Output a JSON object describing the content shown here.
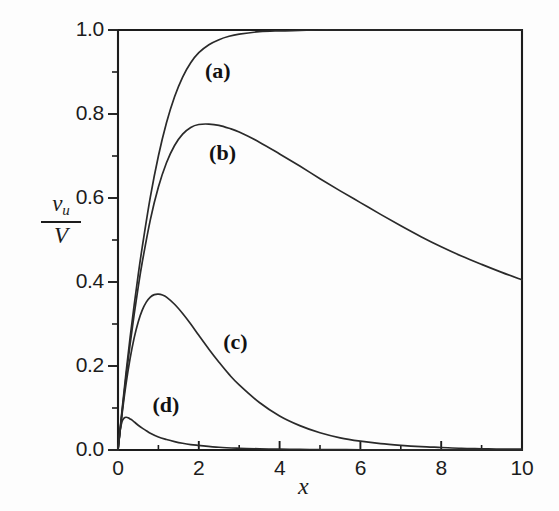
{
  "chart_data": {
    "type": "line",
    "title": "",
    "xlabel": "x",
    "ylabel_numerator": "v",
    "ylabel_numerator_sub": "u",
    "ylabel_denominator": "V",
    "xlim": [
      0,
      10
    ],
    "ylim": [
      0,
      1
    ],
    "grid": false,
    "legend_position": "inline-annotations",
    "x_major_ticks": [
      0,
      2,
      4,
      6,
      8,
      10
    ],
    "x_major_tick_labels": [
      "0",
      "2",
      "4",
      "6",
      "8",
      "10"
    ],
    "x_minor_ticks": [
      1,
      3,
      5,
      7,
      9
    ],
    "y_major_ticks": [
      0.0,
      0.2,
      0.4,
      0.6,
      0.8,
      1.0
    ],
    "y_major_tick_labels": [
      "0.0",
      "0.2",
      "0.4",
      "0.6",
      "0.8",
      "1.0"
    ],
    "y_minor_ticks": [
      0.1,
      0.3,
      0.5,
      0.7,
      0.9
    ],
    "annotations": [
      {
        "text": "(a)",
        "x": 2.6,
        "y": 0.9
      },
      {
        "text": "(b)",
        "x": 2.7,
        "y": 0.705
      },
      {
        "text": "(c)",
        "x": 3.05,
        "y": 0.255
      },
      {
        "text": "(d)",
        "x": 1.3,
        "y": 0.105
      }
    ],
    "series": [
      {
        "name": "(a)",
        "x": [
          0,
          0.1,
          0.2,
          0.3,
          0.4,
          0.5,
          0.6,
          0.8,
          1.0,
          1.2,
          1.4,
          1.6,
          1.8,
          2.0,
          2.25,
          2.5,
          2.75,
          3.0,
          3.5,
          4.0,
          4.5,
          5.0,
          5.5,
          6.0,
          6.5,
          7.0,
          7.5,
          8.0,
          8.5,
          9.0,
          9.5,
          10.0
        ],
        "y": [
          0.0,
          0.095,
          0.185,
          0.268,
          0.345,
          0.417,
          0.483,
          0.602,
          0.7,
          0.779,
          0.841,
          0.888,
          0.922,
          0.946,
          0.965,
          0.977,
          0.985,
          0.99,
          0.996,
          0.998,
          0.999,
          1.0,
          1.0,
          1.0,
          1.0,
          1.0,
          1.0,
          1.0,
          1.0,
          1.0,
          1.0,
          1.0
        ]
      },
      {
        "name": "(b)",
        "x": [
          0,
          0.1,
          0.2,
          0.3,
          0.4,
          0.5,
          0.6,
          0.8,
          1.0,
          1.2,
          1.4,
          1.6,
          1.8,
          2.0,
          2.25,
          2.5,
          2.75,
          3.0,
          3.5,
          4.0,
          4.5,
          5.0,
          5.5,
          6.0,
          6.5,
          7.0,
          7.5,
          8.0,
          8.5,
          9.0,
          9.5,
          10.0
        ],
        "y": [
          0.0,
          0.09,
          0.175,
          0.252,
          0.323,
          0.388,
          0.447,
          0.548,
          0.626,
          0.684,
          0.725,
          0.752,
          0.768,
          0.775,
          0.776,
          0.773,
          0.766,
          0.757,
          0.733,
          0.705,
          0.676,
          0.646,
          0.617,
          0.589,
          0.561,
          0.534,
          0.508,
          0.484,
          0.462,
          0.442,
          0.423,
          0.405
        ]
      },
      {
        "name": "(c)",
        "x": [
          0,
          0.1,
          0.2,
          0.3,
          0.4,
          0.5,
          0.6,
          0.7,
          0.8,
          0.9,
          1.0,
          1.1,
          1.2,
          1.4,
          1.6,
          1.8,
          2.0,
          2.25,
          2.5,
          2.75,
          3.0,
          3.5,
          4.0,
          4.5,
          5.0,
          5.5,
          6.0,
          6.5,
          7.0,
          7.5,
          8.0,
          8.5,
          9.0,
          9.5,
          10.0
        ],
        "y": [
          0.0,
          0.085,
          0.158,
          0.218,
          0.267,
          0.305,
          0.333,
          0.352,
          0.364,
          0.37,
          0.371,
          0.369,
          0.364,
          0.347,
          0.325,
          0.3,
          0.273,
          0.24,
          0.209,
          0.18,
          0.155,
          0.113,
          0.081,
          0.058,
          0.041,
          0.029,
          0.021,
          0.015,
          0.011,
          0.008,
          0.006,
          0.004,
          0.003,
          0.002,
          0.002
        ]
      },
      {
        "name": "(d)",
        "x": [
          0,
          0.05,
          0.1,
          0.15,
          0.2,
          0.25,
          0.3,
          0.35,
          0.4,
          0.5,
          0.6,
          0.7,
          0.8,
          1.0,
          1.2,
          1.4,
          1.6,
          1.8,
          2.0,
          2.5,
          3.0,
          3.5,
          4.0,
          4.5,
          5.0,
          5.5,
          6.0,
          7.0,
          8.0,
          9.0,
          10.0
        ],
        "y": [
          0.0,
          0.045,
          0.068,
          0.076,
          0.078,
          0.077,
          0.074,
          0.071,
          0.067,
          0.059,
          0.052,
          0.046,
          0.04,
          0.031,
          0.025,
          0.02,
          0.016,
          0.013,
          0.011,
          0.0065,
          0.0042,
          0.0028,
          0.0019,
          0.0014,
          0.001,
          0.0008,
          0.0006,
          0.0004,
          0.0003,
          0.0002,
          0.0002
        ]
      }
    ]
  },
  "style": {
    "axis_color": "#1c1c1c",
    "curve_color": "#2a2a2a",
    "background": "#fdfdfd"
  }
}
